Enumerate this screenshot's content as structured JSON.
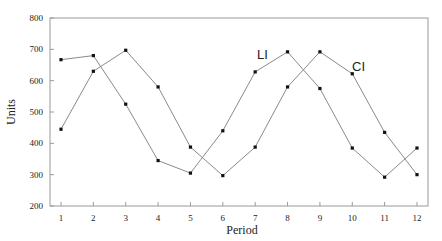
{
  "chart_data": {
    "type": "line",
    "title": "",
    "xlabel": "Period",
    "ylabel": "Units",
    "x": [
      1,
      2,
      3,
      4,
      5,
      6,
      7,
      8,
      9,
      10,
      11,
      12
    ],
    "ylim": [
      200,
      800
    ],
    "yticks": [
      200,
      300,
      400,
      500,
      600,
      700,
      800
    ],
    "grid": false,
    "legend": "inline labels",
    "series": [
      {
        "name": "LI",
        "values": [
          667,
          680,
          525,
          345,
          305,
          440,
          628,
          692,
          575,
          385,
          292,
          385
        ]
      },
      {
        "name": "CI",
        "values": [
          445,
          630,
          697,
          580,
          388,
          297,
          388,
          580,
          692,
          622,
          435,
          300
        ]
      }
    ],
    "annotations": [
      {
        "text": "LI",
        "near_series": "LI",
        "x": 7.2
      },
      {
        "text": "CI",
        "near_series": "CI",
        "x": 10.1
      }
    ]
  }
}
